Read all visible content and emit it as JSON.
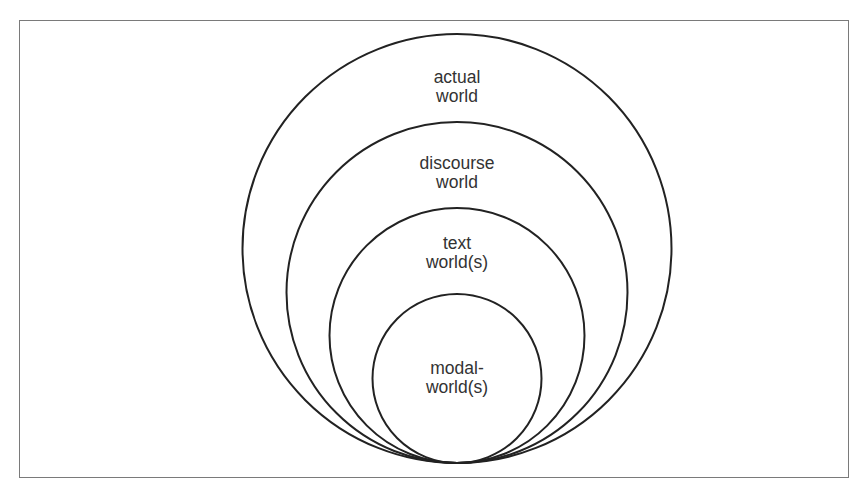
{
  "diagram": {
    "title": "",
    "frame": {
      "stroke": "#7a7a7a"
    },
    "circle_stroke": "#222222",
    "text_color": "#333333",
    "circles": [
      {
        "id": "actual",
        "lines": [
          "actual",
          "world"
        ],
        "cx": 457,
        "cy": 248,
        "r": 213
      },
      {
        "id": "discourse",
        "lines": [
          "discourse",
          "world"
        ],
        "cx": 457,
        "cy": 292,
        "r": 170
      },
      {
        "id": "text",
        "lines": [
          "text",
          "world(s)"
        ],
        "cx": 457,
        "cy": 335,
        "r": 127
      },
      {
        "id": "modal",
        "lines": [
          "modal-",
          "world(s)"
        ],
        "cx": 457,
        "cy": 378,
        "r": 84
      }
    ],
    "relation": "nested circles tangent at bottom point"
  }
}
